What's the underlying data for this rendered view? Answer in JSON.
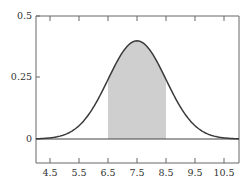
{
  "chart_data": {
    "type": "line",
    "title": "",
    "xlabel": "",
    "ylabel": "",
    "distribution": {
      "mean": 7.5,
      "sd": 1
    },
    "xlim": [
      4.0,
      11.0
    ],
    "ylim": [
      0,
      0.5
    ],
    "x_ticks": [
      4.5,
      5.5,
      6.5,
      7.5,
      8.5,
      9.5,
      10.5
    ],
    "x_tick_labels": [
      "4.5",
      "5.5",
      "6.5",
      "7.5",
      "8.5",
      "9.5",
      "10.5"
    ],
    "y_ticks": [
      0,
      0.25,
      0.5
    ],
    "y_tick_labels": [
      "0",
      "0.25",
      "0.5"
    ],
    "shaded_region": {
      "from": 6.5,
      "to": 8.5,
      "color": "#cfcfcf"
    },
    "series": [
      {
        "name": "density",
        "x": [
          4.0,
          4.5,
          5.0,
          5.5,
          6.0,
          6.5,
          7.0,
          7.5,
          8.0,
          8.5,
          9.0,
          9.5,
          10.0,
          10.5,
          11.0
        ],
        "values": [
          0.0009,
          0.0044,
          0.0175,
          0.054,
          0.1295,
          0.242,
          0.3521,
          0.3989,
          0.3521,
          0.242,
          0.1295,
          0.054,
          0.0175,
          0.0044,
          0.0009
        ],
        "color": "#3a3a3a"
      }
    ],
    "grid": false,
    "legend": null
  },
  "axes": {
    "y_labels": [
      "0",
      "0.25",
      "0.5"
    ],
    "x_labels": [
      "4.5",
      "5.5",
      "6.5",
      "7.5",
      "8.5",
      "9.5",
      "10.5"
    ]
  },
  "colors": {
    "curve": "#3a3a3a",
    "shade": "#cfcfcf",
    "frame": "#555555",
    "baseline": "#444444"
  }
}
